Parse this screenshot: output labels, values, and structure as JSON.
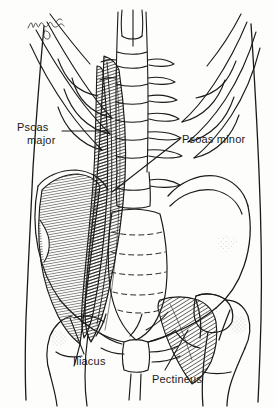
{
  "figure": {
    "signature": "M. Colling",
    "background_color": "#fdfdfb",
    "ink_color": "#1a1a1a",
    "view": "anterior",
    "region": "lower thorax, abdomen, pelvis and proximal femora"
  },
  "labels": [
    {
      "id": "psoas-major",
      "line1": "Psoas",
      "line2": "major",
      "text": "Psoas major",
      "leader": "horizontal-right"
    },
    {
      "id": "psoas-minor",
      "line1": "Psoas minor",
      "line2": "",
      "text": "Psoas minor",
      "leader": "diagonal-down-left"
    },
    {
      "id": "iliacus",
      "line1": "Iliacus",
      "line2": "",
      "text": "Iliacus",
      "leader": "diagonal-up-left"
    },
    {
      "id": "pectineus",
      "line1": "Pectineus",
      "line2": "",
      "text": "Pectineus",
      "leader": "diagonal-up-right"
    }
  ],
  "structures": [
    "rib cage",
    "costal cartilages",
    "thoracic and lumbar vertebral column",
    "intervertebral discs",
    "sacrum",
    "ilium",
    "pubis",
    "ischium",
    "femoral head",
    "greater trochanter",
    "femoral shaft",
    "psoas major muscle",
    "psoas minor tendon",
    "iliacus muscle",
    "pectineus muscle",
    "body surface contour"
  ]
}
